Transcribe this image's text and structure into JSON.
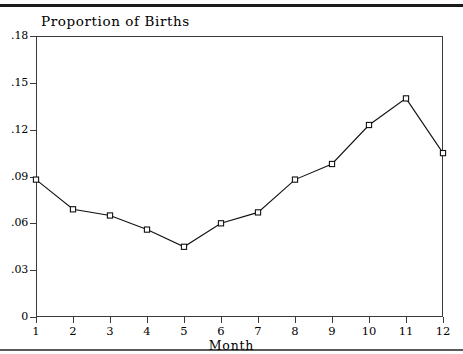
{
  "chart_data": {
    "type": "line",
    "title": "Proportion of Births",
    "xlabel": "Month",
    "ylabel": "",
    "categories": [
      "1",
      "2",
      "3",
      "4",
      "5",
      "6",
      "7",
      "8",
      "9",
      "10",
      "11",
      "12"
    ],
    "x": [
      1,
      2,
      3,
      4,
      5,
      6,
      7,
      8,
      9,
      10,
      11,
      12
    ],
    "values": [
      0.088,
      0.069,
      0.065,
      0.056,
      0.045,
      0.06,
      0.067,
      0.088,
      0.098,
      0.123,
      0.14,
      0.105
    ],
    "xlim": [
      1,
      12
    ],
    "ylim": [
      0,
      0.18
    ],
    "ytick_labels": [
      ".18",
      ".15",
      ".12",
      ".09",
      ".06",
      ".03",
      "0"
    ],
    "ytick_values": [
      0.18,
      0.15,
      0.12,
      0.09,
      0.06,
      0.03,
      0
    ],
    "xtick_labels": [
      "1",
      "2",
      "3",
      "4",
      "5",
      "6",
      "7",
      "8",
      "9",
      "10",
      "11",
      "12"
    ],
    "grid": false,
    "legend": null,
    "marker": "open-square",
    "line_color": "#111111",
    "marker_fill": "#ffffff"
  },
  "page": {
    "title": "Proportion of Births",
    "axis_title_x": "Month"
  }
}
